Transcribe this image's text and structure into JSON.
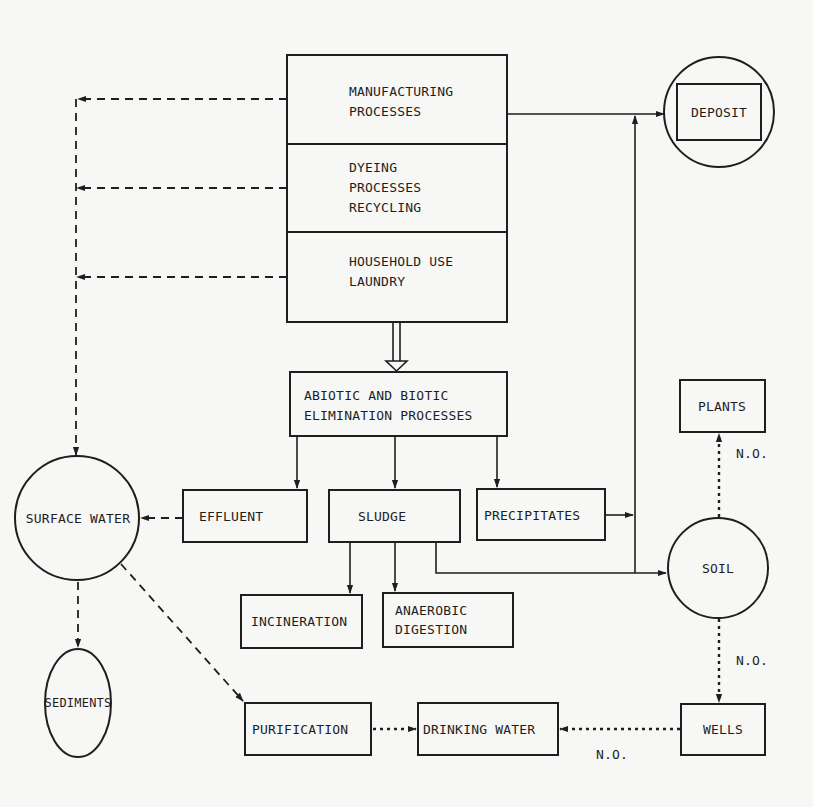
{
  "diagram": {
    "nodes": {
      "manufacturing": {
        "lines": [
          "MANUFACTURING",
          "PROCESSES"
        ],
        "shape": "rect"
      },
      "dyeing": {
        "lines": [
          "DYEING",
          "PROCESSES",
          "RECYCLING"
        ],
        "shape": "rect"
      },
      "household": {
        "lines": [
          "HOUSEHOLD USE",
          "LAUNDRY"
        ],
        "shape": "rect"
      },
      "deposit": {
        "label": "DEPOSIT",
        "shape": "rect-in-circle"
      },
      "elimination": {
        "lines": [
          "ABIOTIC AND BIOTIC",
          "ELIMINATION PROCESSES"
        ],
        "shape": "rect"
      },
      "surface_water": {
        "label": "SURFACE WATER",
        "shape": "circle"
      },
      "effluent": {
        "label": "EFFLUENT",
        "shape": "rect"
      },
      "sludge": {
        "label": "SLUDGE",
        "shape": "rect"
      },
      "precipitates": {
        "label": "PRECIPITATES",
        "shape": "rect"
      },
      "plants": {
        "label": "PLANTS",
        "shape": "rect"
      },
      "soil": {
        "label": "SOIL",
        "shape": "circle"
      },
      "incineration": {
        "label": "INCINERATION",
        "shape": "rect"
      },
      "anaerobic": {
        "lines": [
          "ANAEROBIC",
          "DIGESTION"
        ],
        "shape": "rect"
      },
      "sediments": {
        "label": "SEDIMENTS",
        "shape": "ellipse"
      },
      "purification": {
        "label": "PURIFICATION",
        "shape": "rect"
      },
      "drinking_water": {
        "label": "DRINKING WATER",
        "shape": "rect"
      },
      "wells": {
        "label": "WELLS",
        "shape": "rect"
      }
    },
    "edge_labels": {
      "soil_plants": "N.O.",
      "soil_wells": "N.O.",
      "wells_drinking": "N.O."
    },
    "edges": [
      {
        "from": "manufacturing",
        "to": "surface_water",
        "style": "dashed"
      },
      {
        "from": "dyeing",
        "to": "surface_water",
        "style": "dashed"
      },
      {
        "from": "household",
        "to": "surface_water",
        "style": "dashed"
      },
      {
        "from": "manufacturing",
        "to": "deposit",
        "style": "solid"
      },
      {
        "from": "household",
        "to": "elimination",
        "style": "double"
      },
      {
        "from": "elimination",
        "to": "effluent",
        "style": "solid"
      },
      {
        "from": "elimination",
        "to": "sludge",
        "style": "solid"
      },
      {
        "from": "elimination",
        "to": "precipitates",
        "style": "solid"
      },
      {
        "from": "effluent",
        "to": "surface_water",
        "style": "dashed"
      },
      {
        "from": "precipitates",
        "to": "deposit",
        "style": "solid"
      },
      {
        "from": "sludge",
        "to": "soil",
        "style": "solid"
      },
      {
        "from": "sludge",
        "to": "deposit",
        "style": "solid"
      },
      {
        "from": "sludge",
        "to": "incineration",
        "style": "solid"
      },
      {
        "from": "sludge",
        "to": "anaerobic",
        "style": "solid"
      },
      {
        "from": "surface_water",
        "to": "sediments",
        "style": "dashed"
      },
      {
        "from": "surface_water",
        "to": "purification",
        "style": "dashed"
      },
      {
        "from": "purification",
        "to": "drinking_water",
        "style": "dotted"
      },
      {
        "from": "soil",
        "to": "plants",
        "style": "dotted",
        "label": "N.O."
      },
      {
        "from": "soil",
        "to": "wells",
        "style": "dotted",
        "label": "N.O."
      },
      {
        "from": "wells",
        "to": "drinking_water",
        "style": "dotted",
        "label": "N.O."
      }
    ]
  }
}
